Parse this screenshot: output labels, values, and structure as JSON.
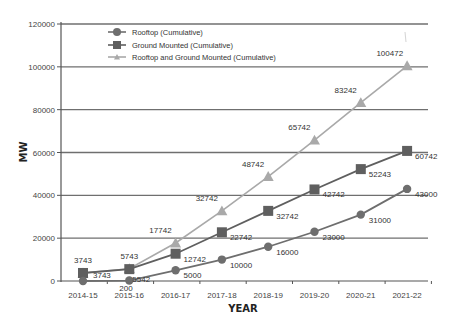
{
  "chart_data": {
    "type": "line",
    "title": "",
    "xlabel": "YEAR",
    "ylabel": "MW",
    "ylim": [
      0,
      120000
    ],
    "yticks": [
      0,
      20000,
      40000,
      60000,
      80000,
      100000,
      120000
    ],
    "ytick_labels": [
      "0",
      "20000",
      "40000",
      "60000",
      "80000",
      "100000",
      "120000"
    ],
    "grid": "horizontal",
    "legend_position": "upper-left-inside",
    "categories": [
      "2014-15",
      "2015-16",
      "2016-17",
      "2017-18",
      "2018-19",
      "2019-20",
      "2020-21",
      "2021-22"
    ],
    "series": [
      {
        "name": "Rooftop (Cumulative)",
        "marker": "circle",
        "color": "#6e6e6e",
        "values": [
          0,
          200,
          5000,
          10000,
          16000,
          23000,
          31000,
          43000
        ],
        "labels": [
          "",
          "200",
          "5000",
          "10000",
          "16000",
          "23000",
          "31000",
          "43000"
        ]
      },
      {
        "name": "Ground Mounted (Cumulative)",
        "marker": "square",
        "color": "#5f5f5f",
        "values": [
          3743,
          5542,
          12742,
          22742,
          32742,
          42742,
          52243,
          60742
        ],
        "labels": [
          "3743",
          "5542",
          "12742",
          "22742",
          "32742",
          "42742",
          "52243",
          "60742"
        ]
      },
      {
        "name": "Rooftop and Ground Mounted (Cumulative)",
        "marker": "triangle",
        "color": "#a9a9a9",
        "values": [
          3743,
          5743,
          17742,
          32742,
          48742,
          65742,
          83242,
          100472
        ],
        "labels": [
          "3743",
          "5743",
          "17742",
          "32742",
          "48742",
          "65742",
          "83242",
          "100472"
        ]
      }
    ]
  }
}
